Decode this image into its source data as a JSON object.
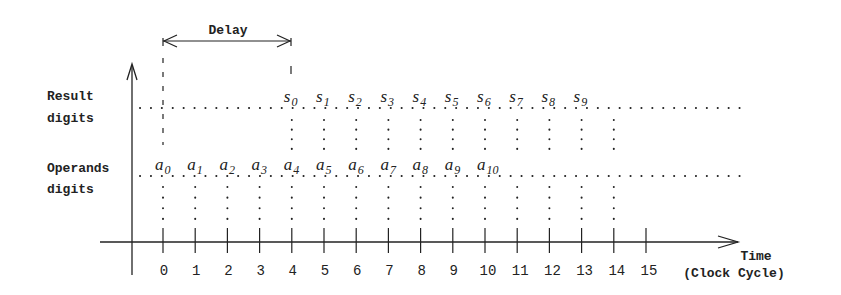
{
  "title": "Delay",
  "labels": {
    "result_line1": "Result",
    "result_line2": "digits",
    "operands_line1": "Operands",
    "operands_line2": "digits",
    "time_line1": "Time",
    "time_line2": "(Clock Cycle)"
  },
  "ticks": [
    "0",
    "1",
    "2",
    "3",
    "4",
    "5",
    "6",
    "7",
    "8",
    "9",
    "10",
    "11",
    "12",
    "13",
    "14",
    "15"
  ],
  "result_digits": [
    {
      "base": "s",
      "sub": "0",
      "cycle": 4
    },
    {
      "base": "s",
      "sub": "1",
      "cycle": 5
    },
    {
      "base": "s",
      "sub": "2",
      "cycle": 6
    },
    {
      "base": "s",
      "sub": "3",
      "cycle": 7
    },
    {
      "base": "s",
      "sub": "4",
      "cycle": 8
    },
    {
      "base": "s",
      "sub": "5",
      "cycle": 9
    },
    {
      "base": "s",
      "sub": "6",
      "cycle": 10
    },
    {
      "base": "s",
      "sub": "7",
      "cycle": 11
    },
    {
      "base": "s",
      "sub": "8",
      "cycle": 12
    },
    {
      "base": "s",
      "sub": "9",
      "cycle": 13
    }
  ],
  "operand_digits": [
    {
      "base": "a",
      "sub": "0",
      "cycle": 0
    },
    {
      "base": "a",
      "sub": "1",
      "cycle": 1
    },
    {
      "base": "a",
      "sub": "2",
      "cycle": 2
    },
    {
      "base": "a",
      "sub": "3",
      "cycle": 3
    },
    {
      "base": "a",
      "sub": "4",
      "cycle": 4
    },
    {
      "base": "a",
      "sub": "5",
      "cycle": 5
    },
    {
      "base": "a",
      "sub": "6",
      "cycle": 6
    },
    {
      "base": "a",
      "sub": "7",
      "cycle": 7
    },
    {
      "base": "a",
      "sub": "8",
      "cycle": 8
    },
    {
      "base": "a",
      "sub": "9",
      "cycle": 9
    },
    {
      "base": "a",
      "sub": "10",
      "cycle": 10
    }
  ],
  "delay": {
    "start_cycle": 0,
    "end_cycle": 4
  },
  "colors": {
    "ink": "#222222",
    "background": "#ffffff"
  }
}
